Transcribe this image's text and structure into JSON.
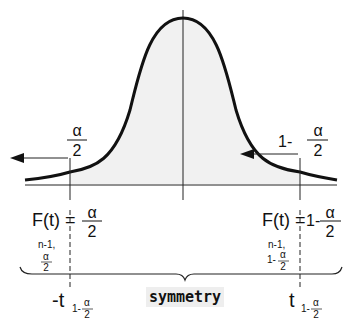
{
  "diagram": {
    "type": "t-distribution density with symmetric quantiles",
    "colors": {
      "curve": "#111111",
      "shade": "#f1f1f1",
      "axis": "#222222",
      "label_bg": "#eeeeee"
    },
    "left": {
      "area_label_num": "α",
      "area_label_den": "2",
      "cdf_prefix": "F(t) =",
      "cdf_num": "α",
      "cdf_den": "2",
      "df_label": "n-1,",
      "df_sub_num": "α",
      "df_sub_den": "2",
      "quantile_label": "-t",
      "quantile_sub_prefix": "1-",
      "quantile_sub_num": "α",
      "quantile_sub_den": "2"
    },
    "right": {
      "area_label_prefix": "1-",
      "area_label_num": "α",
      "area_label_den": "2",
      "cdf_prefix": "F(t) =",
      "cdf_value_prefix": "1-",
      "cdf_num": "α",
      "cdf_den": "2",
      "df_label": "n-1,",
      "df_sub_prefix": "1-",
      "df_sub_num": "α",
      "df_sub_den": "2",
      "quantile_label": "t",
      "quantile_sub_prefix": "1-",
      "quantile_sub_num": "α",
      "quantile_sub_den": "2"
    },
    "brace_label": "symmetry"
  }
}
